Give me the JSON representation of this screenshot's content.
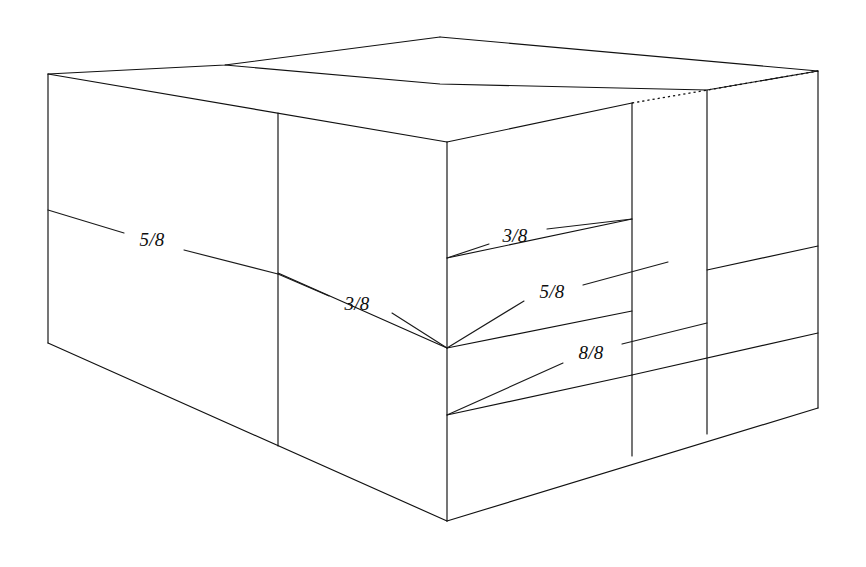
{
  "figure": {
    "name": "carton-stack-isometric-diagram",
    "background_color": "#ffffff",
    "line_color": "#111111",
    "label_color": "#0d0d0d"
  },
  "labels": [
    {
      "id": "label-left-face",
      "text": "5/8",
      "x": 152,
      "y": 240
    },
    {
      "id": "label-front-left-face",
      "text": "3/8",
      "x": 357,
      "y": 304
    },
    {
      "id": "label-front-right-upper",
      "text": "3/8",
      "x": 515,
      "y": 236
    },
    {
      "id": "label-front-right-middle",
      "text": "5/8",
      "x": 552,
      "y": 292
    },
    {
      "id": "label-front-right-lower",
      "text": "8/8",
      "x": 591,
      "y": 353
    }
  ],
  "geometry": {
    "top_face": {
      "points": "48,74 225,65 440,37 818,71 632,103 447,142",
      "note": "top surface of carton stack"
    },
    "outline": "M48,74 L48,343 L447,521 L818,408 L818,71 L440,37 Z",
    "edges": [
      {
        "id": "edge-top-left-vertical",
        "d": "M48,74 L48,343"
      },
      {
        "id": "edge-top-back-left",
        "d": "M48,74 L440,37"
      },
      {
        "id": "edge-top-front-left",
        "d": "M48,74 L447,142"
      },
      {
        "id": "edge-top-back-right",
        "d": "M440,37 L818,71"
      },
      {
        "id": "edge-top-front-right",
        "d": "M447,142 L632,103"
      },
      {
        "id": "edge-front-vertical",
        "d": "M447,142 L447,521"
      },
      {
        "id": "edge-bottom-left",
        "d": "M48,343 L447,521"
      },
      {
        "id": "edge-bottom-right",
        "d": "M447,521 L818,408"
      },
      {
        "id": "edge-right-outer-vertical",
        "d": "M818,71 L818,408"
      },
      {
        "id": "edge-panel-vertical-632",
        "d": "M632,103 L632,455"
      },
      {
        "id": "edge-panel-vertical-707",
        "d": "M707,90 L707,433"
      },
      {
        "id": "edge-panel-vertical-278",
        "d": "M278,112 L278,445"
      },
      {
        "id": "edge-top-seam-1",
        "d": "M225,65 L613,97"
      },
      {
        "id": "edge-top-seam-2",
        "d": "M440,37 L818,71"
      },
      {
        "id": "edge-seam-left-horizontal",
        "d": "M278,273 L447,348"
      },
      {
        "id": "edge-seam-right-upper",
        "d": "M447,258 L632,219"
      },
      {
        "id": "edge-seam-right-lower",
        "d": "M447,348 L632,311"
      },
      {
        "id": "edge-seam-far-right-upper",
        "d": "M707,270 L818,246"
      },
      {
        "id": "edge-seam-far-right-lower",
        "d": "M632,375 L818,333"
      }
    ],
    "hidden_edges": [
      {
        "id": "hidden-top-right-dotted",
        "d": "M632,103 L818,71"
      }
    ],
    "leaders": [
      {
        "id": "leader-5-8-left-in",
        "d": "M48,210 L122,232"
      },
      {
        "id": "leader-5-8-left-out",
        "d": "M182,249 L278,273"
      },
      {
        "id": "leader-3-8-frontleft-in",
        "d": "M278,273 L327,295"
      },
      {
        "id": "leader-3-8-frontleft-out",
        "d": "M390,312 L447,348"
      },
      {
        "id": "leader-3-8-right-in",
        "d": "M447,258 L487,243"
      },
      {
        "id": "leader-3-8-right-out",
        "d": "M545,229 L632,219"
      },
      {
        "id": "leader-5-8-right-in",
        "d": "M447,348 L522,300"
      },
      {
        "id": "leader-5-8-right-out",
        "d": "M580,284 L665,262"
      },
      {
        "id": "leader-8-8-right-in",
        "d": "M447,415 L561,362"
      },
      {
        "id": "leader-8-8-right-out",
        "d": "M620,343 L707,322"
      }
    ]
  }
}
